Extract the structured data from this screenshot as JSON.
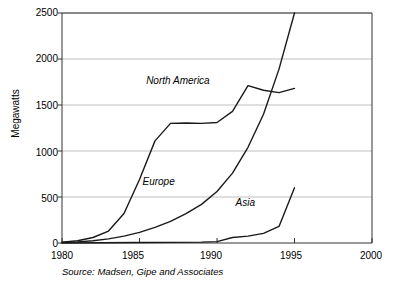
{
  "chart_data": {
    "type": "line",
    "title": "",
    "xlabel": "",
    "ylabel": "Megawatts",
    "xlim": [
      1980,
      2000
    ],
    "ylim": [
      0,
      2500
    ],
    "grid": true,
    "legend_position": "inline-labels",
    "xticks": [
      "1980",
      "1985",
      "1990",
      "1995",
      "2000"
    ],
    "xtick_values": [
      1980,
      1985,
      1990,
      1995,
      2000
    ],
    "yticks": [
      "0",
      "500",
      "1000",
      "1500",
      "2000",
      "2500"
    ],
    "ytick_values": [
      0,
      500,
      1000,
      1500,
      2000,
      2500
    ],
    "annotation": "Source: Madsen, Gipe and Associates",
    "series": [
      {
        "name": "North America",
        "label_x": 1989.3,
        "label_y": 1760,
        "x": [
          1980,
          1981,
          1982,
          1983,
          1984,
          1985,
          1986,
          1987,
          1988,
          1989,
          1990,
          1991,
          1992,
          1993,
          1994,
          1995
        ],
        "values": [
          10,
          25,
          60,
          130,
          320,
          690,
          1110,
          1300,
          1305,
          1300,
          1310,
          1430,
          1710,
          1660,
          1635,
          1680
        ]
      },
      {
        "name": "Europe",
        "label_x": 1987.0,
        "label_y": 660,
        "x": [
          1980,
          1981,
          1982,
          1983,
          1984,
          1985,
          1986,
          1987,
          1988,
          1989,
          1990,
          1991,
          1992,
          1993,
          1994,
          1995
        ],
        "values": [
          5,
          12,
          25,
          45,
          75,
          115,
          170,
          235,
          320,
          420,
          560,
          760,
          1040,
          1400,
          1890,
          2500
        ]
      },
      {
        "name": "Asia",
        "label_x": 1992.1,
        "label_y": 430,
        "x": [
          1980,
          1985,
          1989,
          1990,
          1991,
          1992,
          1993,
          1994,
          1995
        ],
        "values": [
          0,
          5,
          10,
          15,
          60,
          75,
          105,
          180,
          600
        ]
      }
    ],
    "colors": {
      "line": "#1a1a1a",
      "grid": "#bfbfbf",
      "axis": "#333333",
      "text": "#000000",
      "background": "#ffffff"
    }
  }
}
